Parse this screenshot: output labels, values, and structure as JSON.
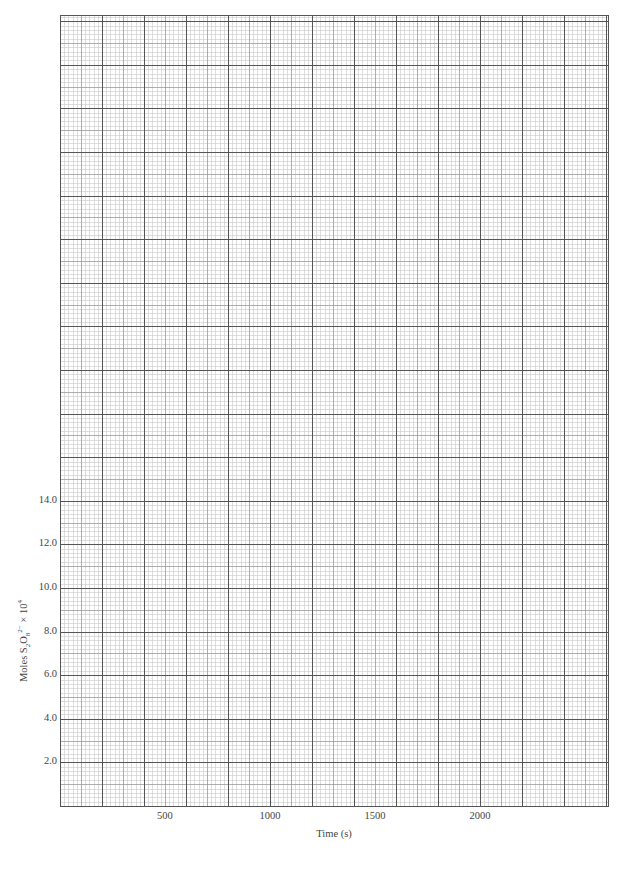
{
  "chart_data": {
    "type": "line",
    "title": "",
    "xlabel": "Time (s)",
    "ylabel": "Moles S2O8^2- x 10^4",
    "ylabel_parts": {
      "prefix": "Moles S",
      "sub1": "2",
      "mid": "O",
      "sub2": "8",
      "sup": "2−",
      "suffix": " × 10",
      "exp": "4"
    },
    "x_ticks": [
      500,
      1000,
      1500,
      2000
    ],
    "x_tick_labels": [
      "500",
      "1000",
      "1500",
      "2000"
    ],
    "y_ticks": [
      2.0,
      4.0,
      6.0,
      8.0,
      10.0,
      12.0,
      14.0
    ],
    "y_tick_labels": [
      "2.0",
      "4.0",
      "6.0",
      "8.0",
      "10.0",
      "12.0",
      "14.0"
    ],
    "xlim": [
      0,
      2610
    ],
    "ylim": [
      0,
      36.3
    ],
    "grid": true,
    "grid_major_x": 200,
    "grid_major_y": 2.0,
    "grid_minor_divisions": 10,
    "series": [],
    "note": "Blank graph paper; no data plotted"
  },
  "colors": {
    "background": "#ffffff",
    "minor_grid": "#c8c8c8",
    "mid_grid": "#9a9a9a",
    "major_grid": "#555555",
    "text": "#444444"
  }
}
